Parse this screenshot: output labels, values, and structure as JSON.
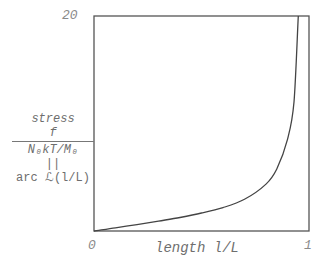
{
  "chart_data": {
    "type": "line",
    "title": "",
    "xlabel": "length l/L",
    "ylabel": "stress f / (N0 kT / M0) = arc ℒ(l/L)",
    "xlim": [
      0,
      1
    ],
    "ylim": [
      0,
      20
    ],
    "grid": false,
    "legend": null,
    "x_ticks": [
      "0",
      "1"
    ],
    "y_ticks": [
      "20"
    ],
    "series": [
      {
        "name": "inverse Langevin function",
        "x": [
          0,
          0.1,
          0.2,
          0.3,
          0.4,
          0.5,
          0.6,
          0.7,
          0.8,
          0.85,
          0.9,
          0.93,
          0.95
        ],
        "y": [
          0,
          0.3,
          0.6,
          0.92,
          1.26,
          1.67,
          2.18,
          2.95,
          4.36,
          5.77,
          8.53,
          12.0,
          20.0
        ]
      }
    ]
  },
  "axes": {
    "y_top_tick": "20",
    "x_left_tick": "0",
    "x_right_tick": "1",
    "x_label": "length l/L",
    "y_label": {
      "line1": "stress",
      "numerator": "f",
      "denominator": "N₀kT/M₀",
      "equals": "||",
      "line4": "arc ℒ(l/L)"
    }
  }
}
